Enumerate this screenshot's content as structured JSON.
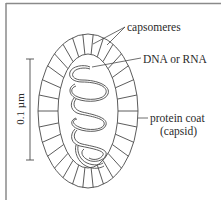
{
  "figure": {
    "labels": {
      "capsomeres": "capsomeres",
      "nucleic_acid": "DNA or RNA",
      "protein_coat_line1": "protein coat",
      "protein_coat_line2": "(capsid)"
    },
    "scale_bar": {
      "label": "0.1 µm"
    },
    "colors": {
      "line": "#4a4a4a",
      "text": "#2a2a2a",
      "border": "#8a8a8a",
      "background": "#ffffff"
    }
  }
}
